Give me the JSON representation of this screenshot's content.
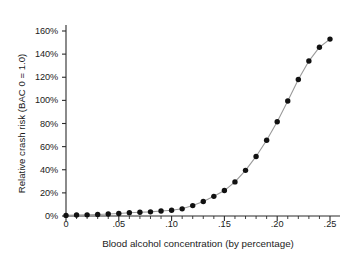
{
  "chart_data": {
    "type": "line",
    "title": "",
    "xlabel": "Blood alcohol concentration (by percentage)",
    "ylabel": "Relative crash risk (BAC 0 = 1.0)",
    "xlim": [
      0,
      0.25
    ],
    "ylim": [
      0,
      160
    ],
    "grid": false,
    "legend": null,
    "marker": "filled-circle",
    "marker_color": "#111111",
    "line_color": "#9a9a9a",
    "axis_color": "#2b2b2b",
    "x_ticks": [
      0,
      0.05,
      0.1,
      0.15,
      0.2,
      0.25
    ],
    "x_tick_labels": [
      "0",
      ".05",
      ".10",
      ".15",
      ".20",
      ".25"
    ],
    "x_minor_tick_step": 0.01,
    "y_ticks": [
      0,
      20,
      40,
      60,
      80,
      100,
      120,
      140,
      160
    ],
    "y_tick_labels": [
      "0%",
      "20%",
      "40%",
      "60%",
      "80%",
      "100%",
      "120%",
      "140%",
      "160%"
    ],
    "x": [
      0.0,
      0.01,
      0.02,
      0.03,
      0.04,
      0.05,
      0.06,
      0.07,
      0.08,
      0.09,
      0.1,
      0.11,
      0.12,
      0.13,
      0.14,
      0.15,
      0.16,
      0.17,
      0.18,
      0.19,
      0.2,
      0.21,
      0.22,
      0.23,
      0.24,
      0.25
    ],
    "values": [
      0.5,
      0.8,
      1.0,
      1.3,
      1.7,
      2.2,
      2.8,
      3.2,
      3.6,
      4.3,
      5.0,
      6.2,
      9.0,
      12.5,
      17.0,
      22.0,
      29.5,
      39.5,
      51.5,
      65.5,
      81.5,
      99.5,
      118.0,
      134.0,
      146.0,
      153.0
    ],
    "y_unit": "%"
  }
}
